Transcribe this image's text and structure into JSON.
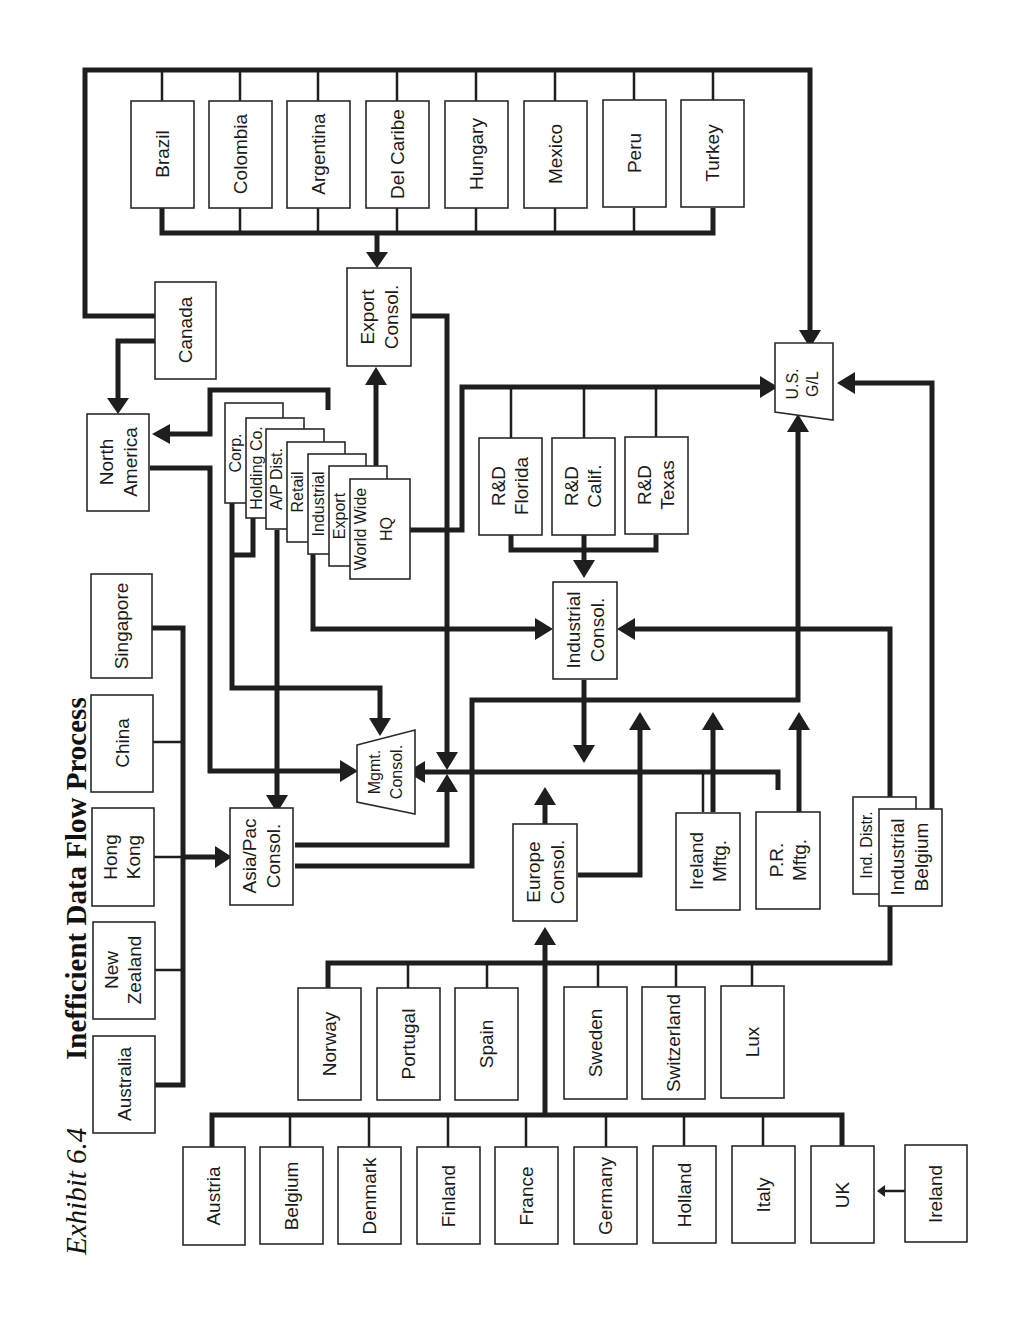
{
  "title": {
    "exhibit": "Exhibit 6.4",
    "text": "Inefficient Data Flow Process"
  },
  "nodes": {
    "latam": [
      "Brazil",
      "Colombia",
      "Argentina",
      "Del Caribe",
      "Hungary",
      "Mexico",
      "Peru",
      "Turkey"
    ],
    "canada": "Canada",
    "north_america": [
      "North",
      "America"
    ],
    "export_consol": [
      "Export",
      "Consol."
    ],
    "hq_stack": [
      "Corp.",
      "Holding Co.",
      "A/P Dist.",
      "Retail",
      "Industrial",
      "Export",
      "World Wide",
      "HQ"
    ],
    "rd": [
      [
        "R&D",
        "Florida"
      ],
      [
        "R&D",
        "Calif."
      ],
      [
        "R&D",
        "Texas"
      ]
    ],
    "us_gl": [
      "U.S.",
      "G/L"
    ],
    "industrial_consol": [
      "Industrial",
      "Consol."
    ],
    "asia": [
      "Singapore",
      "China",
      "Hong Kong",
      "New Zealand",
      "Australia"
    ],
    "asia_labels": [
      [
        "Singapore"
      ],
      [
        "China"
      ],
      [
        "Hong",
        "Kong"
      ],
      [
        "New",
        "Zealand"
      ],
      [
        "Australia"
      ]
    ],
    "asiapac_consol": [
      "Asia/Pac",
      "Consol."
    ],
    "mgmt_consol": [
      "Mgmt.",
      "Consol."
    ],
    "europe_consol": [
      "Europe",
      "Consol."
    ],
    "ireland_mftg": [
      "Ireland",
      "Mftg."
    ],
    "pr_mftg": [
      "P.R.",
      "Mftg."
    ],
    "ind_distr": "Ind. Distr.",
    "industrial_belgium": [
      "Industrial",
      "Belgium"
    ],
    "europe_mid": [
      "Norway",
      "Portugal",
      "Spain",
      "Sweden",
      "Switzerland",
      "Lux"
    ],
    "europe_low": [
      "Austria",
      "Belgium",
      "Denmark",
      "Finland",
      "France",
      "Germany",
      "Holland",
      "Italy",
      "UK"
    ],
    "ireland": "Ireland"
  },
  "colors": {
    "line": "#1e1e1e",
    "box_border": "#2a2a2a",
    "background": "#ffffff"
  }
}
